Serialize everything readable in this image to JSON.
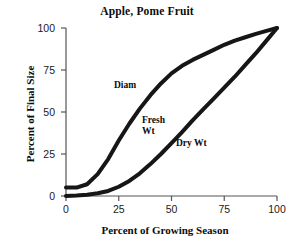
{
  "chart_data": {
    "type": "line",
    "title": "Apple, Pome Fruit",
    "xlabel": "Percent of Growing Season",
    "ylabel": "Percent of Final Size",
    "xlim": [
      0,
      100
    ],
    "ylim": [
      0,
      100
    ],
    "xticks": [
      "0",
      "25",
      "50",
      "75",
      "100"
    ],
    "yticks": [
      "0",
      "25",
      "50",
      "75",
      "100"
    ],
    "xtick_values": [
      0,
      25,
      50,
      75,
      100
    ],
    "ytick_values": [
      0,
      25,
      50,
      75,
      100
    ],
    "grid": false,
    "legend": "inline-annotations",
    "line_color": "#161616",
    "axis_color": "#555555",
    "series": [
      {
        "name": "Diam",
        "label": "Diam",
        "x": [
          0,
          5,
          10,
          15,
          20,
          25,
          30,
          35,
          40,
          45,
          50,
          55,
          60,
          65,
          70,
          75,
          80,
          85,
          90,
          95,
          100
        ],
        "values": [
          5,
          5,
          7,
          13,
          22,
          33,
          43,
          52,
          60,
          67,
          73,
          77.5,
          81,
          84,
          87,
          90,
          92.5,
          94.5,
          96.5,
          98.3,
          100
        ]
      },
      {
        "name": "Fresh Wt",
        "label": "Fresh Wt",
        "x": [
          0,
          5,
          10,
          15,
          20,
          25,
          30,
          35,
          40,
          45,
          50,
          55,
          60,
          65,
          70,
          75,
          80,
          85,
          90,
          95,
          100
        ],
        "values": [
          0,
          0.3,
          0.8,
          1.6,
          3,
          5.5,
          9,
          13.5,
          19,
          25,
          31.5,
          38,
          45,
          51.5,
          58,
          64.5,
          71,
          78,
          85,
          92.5,
          100
        ]
      },
      {
        "name": "Dry Wt",
        "label": "Dry Wt",
        "x": [
          0,
          5,
          10,
          15,
          20,
          25,
          30,
          35,
          40,
          45,
          50,
          55,
          60,
          65,
          70,
          75,
          80,
          85,
          90,
          95,
          100
        ],
        "values": [
          0,
          0.3,
          0.8,
          1.6,
          3,
          5.5,
          9,
          13.5,
          19,
          25,
          31.5,
          38,
          45,
          51.5,
          58,
          64.5,
          71,
          78,
          85,
          92.5,
          100
        ]
      }
    ],
    "annotations": [
      {
        "text": "Diam",
        "x": 22,
        "y": 67
      },
      {
        "text": "Fresh Wt",
        "x": 36,
        "y": 45
      },
      {
        "text": "Dry Wt",
        "x": 53,
        "y": 33
      }
    ]
  }
}
